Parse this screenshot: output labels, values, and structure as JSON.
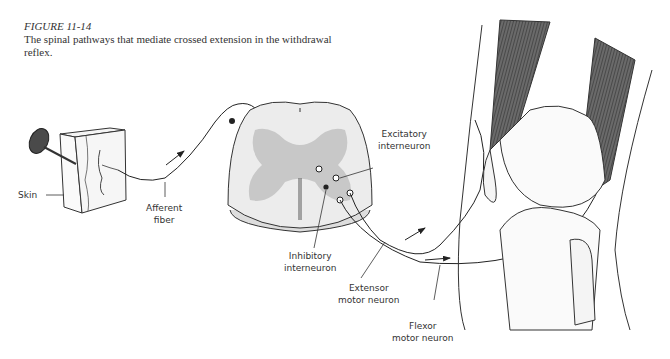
{
  "caption": {
    "figure_number": "FIGURE 11-14",
    "text": "The spinal pathways that mediate crossed extension in the withdrawal reflex."
  },
  "labels": {
    "skin": "Skin",
    "afferent_fiber_1": "Afferent",
    "afferent_fiber_2": "fiber",
    "excitatory_1": "Excitatory",
    "excitatory_2": "interneuron",
    "inhibitory_1": "Inhibitory",
    "inhibitory_2": "interneuron",
    "extensor_1": "Extensor",
    "extensor_2": "motor neuron",
    "flexor_1": "Flexor",
    "flexor_2": "motor neuron"
  },
  "colors": {
    "line": "#2a2a2a",
    "gray_matter": "#c8c8c8",
    "white_matter": "#ececec",
    "muscle": "#555555",
    "tack": "#555555"
  }
}
